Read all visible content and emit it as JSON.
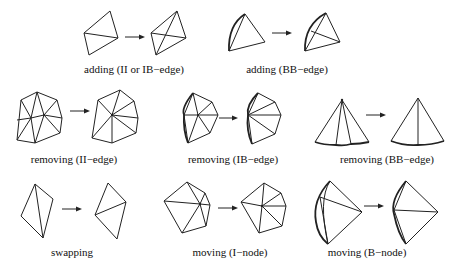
{
  "figure": {
    "panels": [
      {
        "id": "adding-ii-ib",
        "caption": "adding (II or IB−edge)"
      },
      {
        "id": "adding-bb",
        "caption": "adding (BB−edge)"
      },
      {
        "id": "removing-ii",
        "caption": "removing (II−edge)"
      },
      {
        "id": "removing-ib",
        "caption": "removing (IB−edge)"
      },
      {
        "id": "removing-bb",
        "caption": "removing (BB−edge)"
      },
      {
        "id": "swapping",
        "caption": "swapping"
      },
      {
        "id": "moving-i",
        "caption": "moving (I−node)"
      },
      {
        "id": "moving-b",
        "caption": "moving (B−node)"
      }
    ],
    "arrow_icon": "right-arrow-icon"
  }
}
